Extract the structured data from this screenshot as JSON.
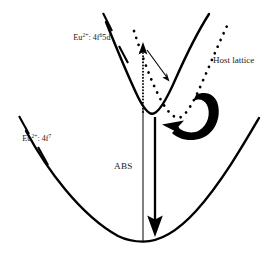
{
  "figure": {
    "kind": "configurational-coordinate-diagram",
    "background_color": "#ffffff",
    "ink_color": "#000000",
    "width": 280,
    "height": 255
  },
  "labels": {
    "excited_state": {
      "prefix": "Eu",
      "charge": "2+",
      "separator": ": 4f",
      "exponent": "6",
      "suffix": "5d",
      "full_text": "Eu2+: 4f65d"
    },
    "ground_state": {
      "prefix": "Eu",
      "charge": "2+",
      "separator": ": 4f",
      "exponent": "7",
      "suffix": "",
      "full_text": "Eu2+: 4f7"
    },
    "host_lattice": {
      "text": "Host lattice"
    },
    "absorption": {
      "text": "ABS"
    }
  },
  "curves": {
    "ground_state_parabola": {
      "name": "Eu2+: 4f7 ground state potential curve",
      "style": "solid",
      "minimum": [
        143,
        241
      ],
      "path": "M 26,131 C 46,168 80,215 118,236 C 127,240.5 136,241.6 143,241.6 C 158,241.6 176,233 196,211 C 222,182 245,142 259,118"
    },
    "excited_state_parabola": {
      "name": "Eu2+: 4f65d excited state potential curve",
      "style": "solid",
      "minimum": [
        152,
        117
      ],
      "path": "M 106,22 C 116,47 128,76 138,97 C 143,107 148,113.6 152,113.8 C 158,114.1 166,101 176,78 C 188,51 202,25 209,14"
    },
    "host_lattice_parabola": {
      "name": "Host lattice dotted potential curve",
      "style": "dotted",
      "minimum": [
        178,
        118
      ],
      "path": "M 134,31 C 142,56 152,84 162,102 C 168,112.5 174,117.6 178,117.8 C 184,118.1 192,106 201,85 C 212,60 222,36 228,24"
    }
  },
  "arrows": {
    "absorption_line": {
      "name": "absorption vertical line",
      "description": "thin vertical line from ground-state minimum up to excited-state curve",
      "x": 143,
      "y_bottom": 241,
      "y_top": 110,
      "style": "thin-solid"
    },
    "dotted_excitation": {
      "name": "dotted vertical excitation line with up arrowhead",
      "x": 143,
      "y_bottom": 112,
      "y_top": 50,
      "arrowhead": "up",
      "style": "dotted"
    },
    "relaxation_arrow": {
      "name": "small diagonal relaxation arrow",
      "from": [
        146,
        50
      ],
      "to": [
        167,
        78
      ],
      "arrowhead": "down-right",
      "style": "thin-solid"
    },
    "emission_arrow": {
      "name": "thick vertical emission arrow",
      "x": 155,
      "y_top": 118,
      "y_bottom": 236,
      "arrowhead": "down",
      "style": "thick-solid"
    },
    "hook_arrow": {
      "name": "thick curved hook arrow indicating energy transfer to host lattice",
      "arrowhead": "left",
      "style": "thick-curved-filled"
    }
  },
  "leaders": {
    "excited_state_upper": {
      "from": [
        104,
        14
      ],
      "to": [
        112,
        31
      ]
    },
    "excited_state_lower": {
      "from": [
        120,
        47
      ],
      "to": [
        129,
        62
      ]
    },
    "ground_state_upper": {
      "from": [
        20,
        117
      ],
      "to": [
        29,
        133
      ]
    },
    "ground_state_lower": {
      "from": [
        39,
        148
      ],
      "to": [
        48,
        164
      ]
    }
  }
}
